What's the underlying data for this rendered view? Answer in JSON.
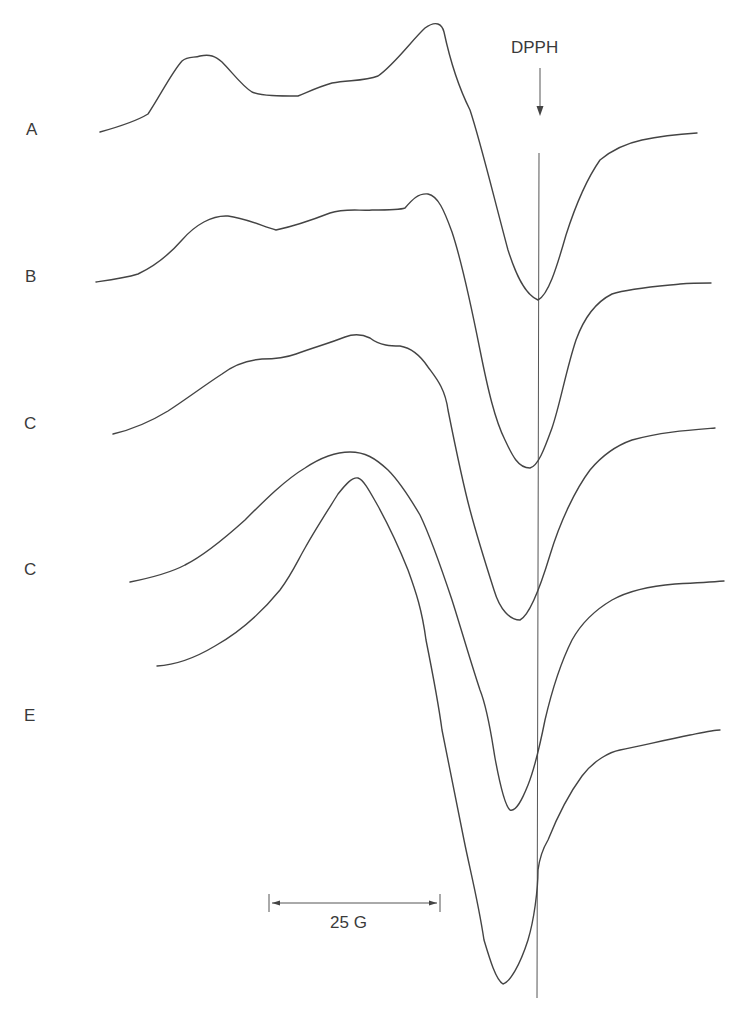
{
  "figure": {
    "type": "EPR spectra (stacked first-derivative traces)",
    "reference_marker": {
      "label": "DPPH",
      "arrow": "down"
    },
    "scale_bar": {
      "label": "25 G"
    },
    "traces": [
      {
        "label": "A"
      },
      {
        "label": "B"
      },
      {
        "label": "C"
      },
      {
        "label": "C"
      },
      {
        "label": "E"
      }
    ],
    "colors": {
      "line": "#444444",
      "background": "#ffffff",
      "text": "#3a3a3a"
    }
  }
}
